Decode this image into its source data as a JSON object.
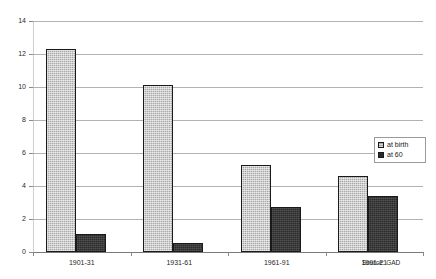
{
  "chart_data": {
    "type": "bar",
    "title": "",
    "xlabel": "",
    "ylabel": "",
    "ylim": [
      0,
      14
    ],
    "ytick_step": 2,
    "yticks": [
      "0",
      "2",
      "4",
      "6",
      "8",
      "10",
      "12",
      "14"
    ],
    "grid": true,
    "legend_position": "right",
    "categories": [
      "1901-31",
      "1931-61",
      "1961-91",
      "1991-21"
    ],
    "series": [
      {
        "name": "at birth",
        "values": [
          12.3,
          10.1,
          5.3,
          4.6
        ],
        "color": "#a8a8a8"
      },
      {
        "name": "at 60",
        "values": [
          1.1,
          0.55,
          2.7,
          3.4
        ],
        "color": "#2b2b2b"
      }
    ],
    "annotations": {
      "source": "Source: GAD"
    }
  },
  "legend": {
    "items": [
      {
        "label": "at birth"
      },
      {
        "label": "at 60"
      }
    ]
  },
  "footer": {
    "source": "Source: GAD"
  }
}
